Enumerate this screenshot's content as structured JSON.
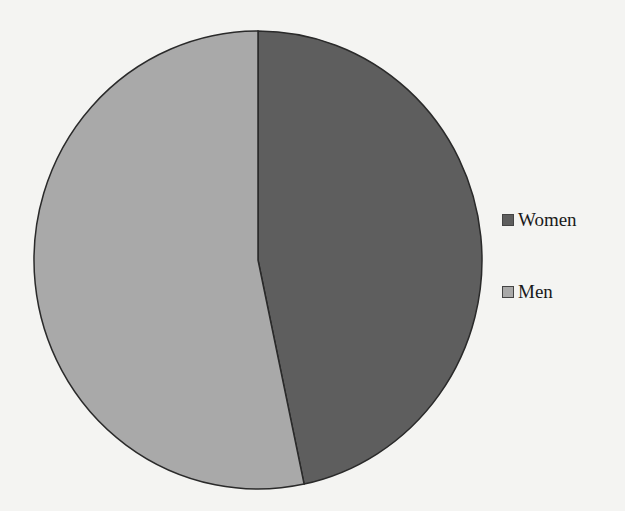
{
  "chart_data": {
    "type": "pie",
    "title": "",
    "categories": [
      "Women",
      "Men"
    ],
    "values": [
      46.7,
      53.3
    ],
    "colors": [
      "#5e5e5e",
      "#a9a9a9"
    ],
    "start_angle_deg": 0,
    "direction": "clockwise",
    "legend_position": "right",
    "data_labels": false
  },
  "legend": {
    "items": [
      {
        "label": "Women",
        "color": "#5e5e5e"
      },
      {
        "label": "Men",
        "color": "#a9a9a9"
      }
    ]
  }
}
